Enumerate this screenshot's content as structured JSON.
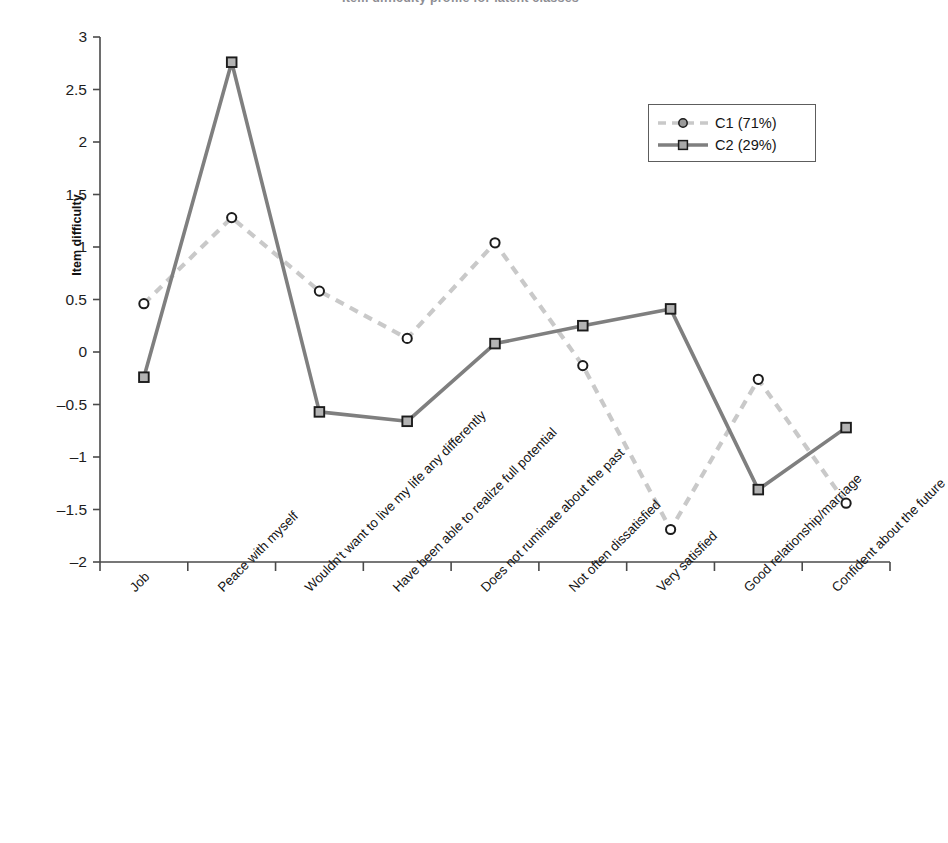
{
  "figure": {
    "title_remnant": "Item difficulty profile for latent classes",
    "ylabel": "Item difficulty"
  },
  "legend": {
    "position": "upper-right-inside",
    "entries": [
      {
        "label": "C1 (71%)",
        "style": "dashed",
        "marker": "circle",
        "color": "#c9c9c9",
        "marker_fill": "#9a9a9a",
        "marker_stroke": "#1c1c1c"
      },
      {
        "label": "C2 (29%)",
        "style": "solid",
        "marker": "square",
        "color": "#7f7f7f",
        "marker_fill": "#a8a8a8",
        "marker_stroke": "#1c1c1c"
      }
    ]
  },
  "chart_data": {
    "type": "line",
    "title": "",
    "xlabel": "",
    "ylabel": "Item difficulty",
    "ylim": [
      -2,
      3
    ],
    "yticks": [
      3,
      2.5,
      2,
      1.5,
      1,
      0.5,
      0,
      -0.5,
      -1,
      -1.5,
      -2
    ],
    "ytick_labels": [
      "3",
      "2.5",
      "2",
      "1.5",
      "1",
      "0.5",
      "0",
      "–0.5",
      "–1",
      "–1.5",
      "–2"
    ],
    "grid": false,
    "categories": [
      "Job",
      "Peace with myself",
      "Wouldn't want to live my life any differently",
      "Have been able to realize full potential",
      "Does not ruminate about the past",
      "Not often dissatisfied",
      "Very satisfied",
      "Good relationship/marriage",
      "Confident about the future"
    ],
    "series": [
      {
        "name": "C1 (71%)",
        "values": [
          0.46,
          1.28,
          0.58,
          0.13,
          1.04,
          -0.13,
          -1.69,
          -0.26,
          -1.44
        ],
        "style": "dashed",
        "marker": "circle",
        "color": "#c9c9c9"
      },
      {
        "name": "C2 (29%)",
        "values": [
          -0.24,
          2.76,
          -0.57,
          -0.66,
          0.08,
          0.25,
          0.41,
          -1.31,
          -0.72
        ],
        "style": "solid",
        "marker": "square",
        "color": "#7f7f7f"
      }
    ]
  }
}
